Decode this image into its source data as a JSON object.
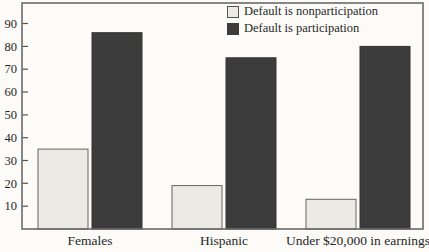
{
  "figure": {
    "background": "#fcfbf8",
    "plot_border_color": "#6a6a6a",
    "tick_color": "#55534e",
    "text_color": "#272727"
  },
  "legend": {
    "position": "top-right-inside",
    "items": [
      {
        "label": "Default is nonparticipation",
        "swatch_color": "#ebeae5",
        "swatch_border": "#55534e"
      },
      {
        "label": "Default is participation",
        "swatch_color": "#3c3c3c",
        "swatch_border": "#3c3c3c"
      }
    ]
  },
  "chart_data": {
    "type": "bar",
    "title": "",
    "xlabel": "",
    "ylabel": "",
    "categories": [
      "Females",
      "Hispanic",
      "Under $20,000 in earnings"
    ],
    "series": [
      {
        "name": "Default is nonparticipation",
        "values": [
          35,
          19,
          13
        ],
        "fill": "#ebeae5",
        "stroke": "#65655f"
      },
      {
        "name": "Default is participation",
        "values": [
          86,
          75,
          80
        ],
        "fill": "#3c3c3c",
        "stroke": "#333330"
      }
    ],
    "yticks": [
      10,
      20,
      30,
      40,
      50,
      60,
      70,
      80,
      90
    ],
    "ylim": [
      0,
      99
    ],
    "grid": false,
    "legend_position": "top-right-inside"
  }
}
